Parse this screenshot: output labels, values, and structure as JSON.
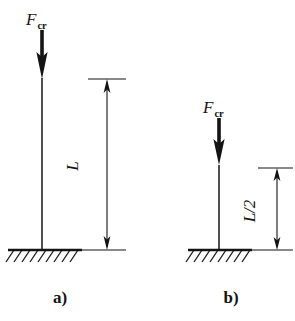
{
  "figure": {
    "background_color": "#ffffff",
    "ink_color": "#141414",
    "panels": [
      {
        "id": "a",
        "caption": "a)",
        "force_label_letter": "F",
        "force_label_subscript": "cr",
        "dimension_label": "L",
        "support_type": "fixed-hatched-ground",
        "column_height_px": 172,
        "hatch_count": 9
      },
      {
        "id": "b",
        "caption": "b)",
        "force_label_letter": "F",
        "force_label_subscript": "cr",
        "dimension_label": "L/2",
        "support_type": "fixed-hatched-ground",
        "column_height_px": 85,
        "hatch_count": 7
      }
    ]
  },
  "geometry": {
    "panel_a": {
      "column_x": 42,
      "column_top_y": 78,
      "column_bottom_y": 250,
      "arrow_tail_y": 30,
      "arrow_tip_y": 78,
      "ground_line_x1": 8,
      "ground_line_x2": 82,
      "ground_line_y": 250,
      "dim_x": 107,
      "dim_top_y": 79,
      "dim_bottom_y": 250,
      "ext_top_x1": 88,
      "ext_top_x2": 126,
      "ext_bottom_x1": 82,
      "ext_bottom_x2": 126,
      "label_x": 78,
      "label_y": 166,
      "caption_x": 60,
      "caption_y": 303
    },
    "panel_b": {
      "column_x": 219,
      "column_top_y": 165,
      "column_bottom_y": 250,
      "arrow_tail_y": 118,
      "arrow_tip_y": 165,
      "ground_line_x1": 188,
      "ground_line_x2": 252,
      "ground_line_y": 250,
      "dim_x": 277,
      "dim_top_y": 168,
      "dim_bottom_y": 250,
      "ext_top_x1": 258,
      "ext_top_x2": 293,
      "ext_bottom_x1": 252,
      "ext_bottom_x2": 293,
      "label_x": 255,
      "label_y": 211,
      "caption_x": 231,
      "caption_y": 303
    }
  }
}
